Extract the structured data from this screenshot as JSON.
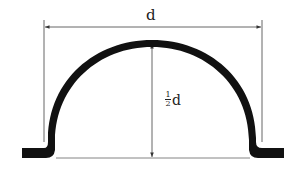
{
  "labels": {
    "width": "d",
    "height_num": "1",
    "height_den": "2",
    "height_var": "d"
  },
  "colors": {
    "stroke": "#111111",
    "dimension_line": "#555555",
    "background": "#ffffff"
  },
  "dimensions": {
    "width_label": "d",
    "height_label": "½d"
  }
}
